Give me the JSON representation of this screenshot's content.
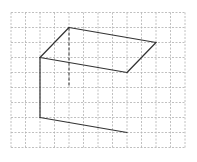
{
  "diagram": {
    "type": "3d-figure-on-grid",
    "background": "#ffffff",
    "grid": {
      "origin_px": [
        11,
        12.5
      ],
      "cell_w": 14.5,
      "cell_h": 15,
      "cols": 12,
      "rows": 9,
      "line_color": "#b0b0b0",
      "dash": "2,1.5"
    },
    "stroke_color": "#333333",
    "solid_edges": [
      [
        [
          2,
          3
        ],
        [
          4,
          1
        ]
      ],
      [
        [
          4,
          1
        ],
        [
          10,
          2
        ]
      ],
      [
        [
          10,
          2
        ],
        [
          8,
          4
        ]
      ],
      [
        [
          8,
          4
        ],
        [
          2,
          3
        ]
      ],
      [
        [
          2,
          3
        ],
        [
          2,
          7
        ]
      ],
      [
        [
          2,
          7
        ],
        [
          8,
          8
        ]
      ]
    ],
    "hidden_edges": [
      [
        [
          4,
          1
        ],
        [
          4,
          5
        ]
      ]
    ]
  }
}
